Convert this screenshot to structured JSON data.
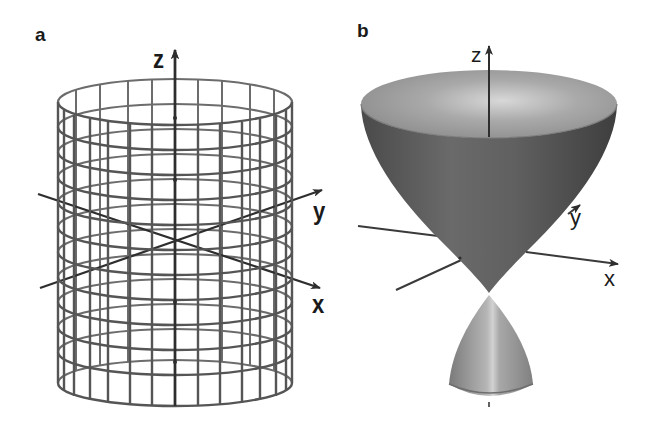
{
  "figure": {
    "panels": [
      {
        "id": "a",
        "label": "a",
        "surface": "circular cylinder (wireframe mesh)",
        "axes": {
          "z": "z",
          "y": "y",
          "x": "x"
        }
      },
      {
        "id": "b",
        "label": "b",
        "surface": "two-sheet cone / double paraboloid-like solid surface",
        "axes": {
          "z": "z",
          "y": "y",
          "x": "x"
        }
      }
    ]
  },
  "colors": {
    "mesh_line": "#5a5a5a",
    "axis_line": "#2e2e2e",
    "surface_light": "#a8a8a8",
    "surface_dark": "#555555",
    "background": "#ffffff"
  }
}
